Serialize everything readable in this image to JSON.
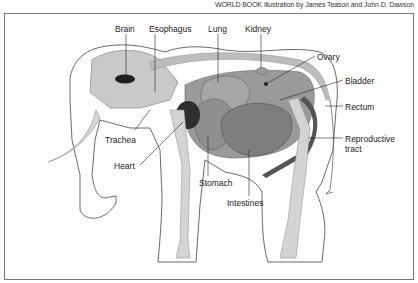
{
  "credit": "WORLD BOOK illustration by James Teason and John D. Dawson",
  "diagram": {
    "labels": [
      {
        "id": "brain",
        "text": "Brain",
        "x": 115,
        "y": 24
      },
      {
        "id": "esophagus",
        "text": "Esophagus",
        "x": 149,
        "y": 24
      },
      {
        "id": "lung",
        "text": "Lung",
        "x": 208,
        "y": 24
      },
      {
        "id": "kidney",
        "text": "Kidney",
        "x": 245,
        "y": 24
      },
      {
        "id": "ovary",
        "text": "Ovary",
        "x": 317,
        "y": 52
      },
      {
        "id": "bladder",
        "text": "Bladder",
        "x": 345,
        "y": 76
      },
      {
        "id": "rectum",
        "text": "Rectum",
        "x": 345,
        "y": 102
      },
      {
        "id": "reproductive",
        "text": "Reproductive",
        "x": 345,
        "y": 134
      },
      {
        "id": "reproductive2",
        "text": "tract",
        "x": 345,
        "y": 144
      },
      {
        "id": "trachea",
        "text": "Trachea",
        "x": 105,
        "y": 135
      },
      {
        "id": "heart",
        "text": "Heart",
        "x": 114,
        "y": 161
      },
      {
        "id": "stomach",
        "text": "Stomach",
        "x": 199,
        "y": 178
      },
      {
        "id": "intestines",
        "text": "Intestines",
        "x": 227,
        "y": 198
      }
    ]
  },
  "colors": {
    "outline": "#444444",
    "organ_dark": "#333333",
    "organ_mid": "#8a8a8a",
    "bone": "#d4d4d4",
    "frame": "#777777"
  }
}
